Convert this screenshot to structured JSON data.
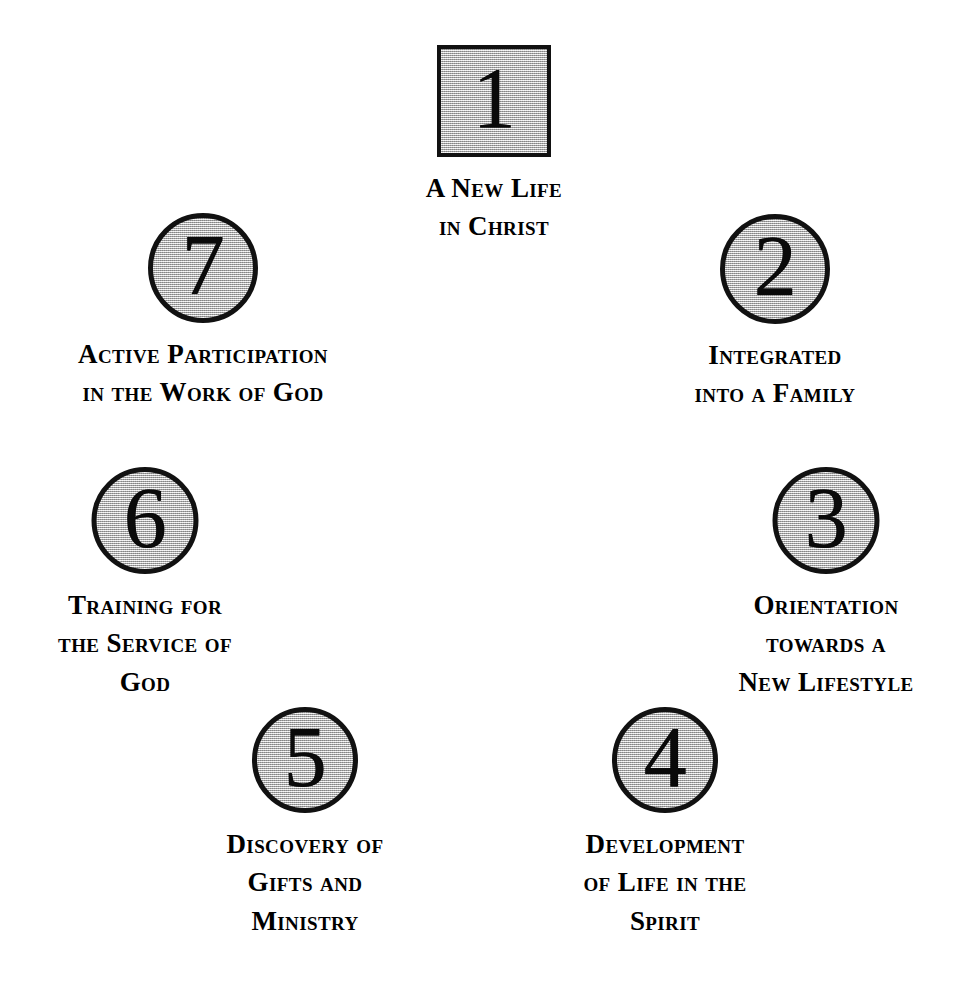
{
  "diagram": {
    "shape_fill_color": "#c3c3c3",
    "shape_border_color": "#111111",
    "text_color": "#000000",
    "background_color": "#ffffff",
    "layout": "circular-cycle",
    "nodes": [
      {
        "number": "1",
        "shape": "square",
        "lines": [
          "A New Life",
          "in Christ"
        ]
      },
      {
        "number": "2",
        "shape": "circle",
        "lines": [
          "Integrated",
          "into a Family"
        ]
      },
      {
        "number": "3",
        "shape": "circle",
        "lines": [
          "Orientation",
          "towards  a",
          "New Lifestyle"
        ]
      },
      {
        "number": "4",
        "shape": "circle",
        "lines": [
          "Development",
          "of Life in the",
          "Spirit"
        ]
      },
      {
        "number": "5",
        "shape": "circle",
        "lines": [
          "Discovery of",
          "Gifts and",
          "Ministry"
        ]
      },
      {
        "number": "6",
        "shape": "circle",
        "lines": [
          "Training for",
          "the Service of",
          "God"
        ]
      },
      {
        "number": "7",
        "shape": "circle",
        "lines": [
          "Active Participation",
          "in the Work of God"
        ]
      }
    ]
  }
}
